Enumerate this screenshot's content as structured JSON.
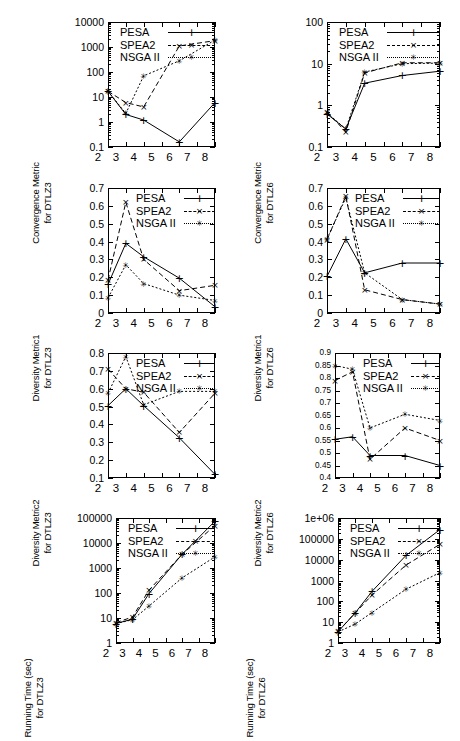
{
  "figure": {
    "width": 460,
    "height": 678,
    "columns": 2,
    "rows": 4,
    "series_names": [
      "PESA",
      "SPEA2",
      "NSGA II"
    ],
    "x_axis_label": "",
    "x_categories": [
      "2",
      "3",
      "4",
      "5",
      "6",
      "7",
      "8"
    ]
  },
  "legend": {
    "pesa": "PESA",
    "spea2": "SPEA2",
    "nsga2": "NSGA II"
  },
  "chart_data": [
    {
      "id": "convergence-dtlz3",
      "type": "line",
      "title": "",
      "ylabel_line1": "Convergence Metric",
      "ylabel_line2": "for DTLZ3",
      "xlabel": "",
      "yscale": "log",
      "ylim": [
        0.1,
        10000
      ],
      "yticks": [
        0.1,
        1,
        10,
        100,
        1000,
        10000
      ],
      "yticklabels": [
        "0.1",
        "1",
        "10",
        "100",
        "1000",
        "10000"
      ],
      "xlim": [
        2,
        8
      ],
      "xticks": [
        2,
        3,
        4,
        5,
        6,
        7,
        8
      ],
      "xticklabels": [
        "2",
        "3",
        "4",
        "5",
        "6",
        "7",
        "8"
      ],
      "grid": false,
      "legend_position": "top-left-inside",
      "x": [
        2,
        3,
        4,
        6,
        8
      ],
      "series": [
        {
          "name": "PESA",
          "values": [
            17,
            2.0,
            1.2,
            0.16,
            6.0
          ]
        },
        {
          "name": "SPEA2",
          "values": [
            17,
            6.0,
            4.0,
            1100,
            1800
          ]
        },
        {
          "name": "NSGA II",
          "values": [
            17,
            2.2,
            70,
            280,
            1900
          ]
        }
      ]
    },
    {
      "id": "convergence-dtlz6",
      "type": "line",
      "title": "",
      "ylabel_line1": "Convergence Metric",
      "ylabel_line2": "for DTLZ6",
      "xlabel": "",
      "yscale": "log",
      "ylim": [
        0.1,
        100
      ],
      "yticks": [
        0.1,
        1,
        10,
        100
      ],
      "yticklabels": [
        "0.1",
        "1",
        "10",
        "100"
      ],
      "xlim": [
        2,
        8
      ],
      "xticks": [
        2,
        3,
        4,
        5,
        6,
        7,
        8
      ],
      "xticklabels": [
        "2",
        "3",
        "4",
        "5",
        "6",
        "7",
        "8"
      ],
      "grid": false,
      "legend_position": "top-left-inside",
      "x": [
        2,
        3,
        4,
        6,
        8
      ],
      "series": [
        {
          "name": "PESA",
          "values": [
            0.62,
            0.27,
            3.4,
            5.2,
            6.6
          ]
        },
        {
          "name": "SPEA2",
          "values": [
            0.7,
            0.23,
            6.0,
            10.5,
            10.5
          ]
        },
        {
          "name": "NSGA II",
          "values": [
            0.66,
            0.27,
            6.3,
            10.0,
            10.3
          ]
        }
      ]
    },
    {
      "id": "diversity1-dtlz3",
      "type": "line",
      "title": "",
      "ylabel_line1": "Diversity Metric1",
      "ylabel_line2": "for DTLZ3",
      "xlabel": "",
      "yscale": "linear",
      "ylim": [
        0,
        0.7
      ],
      "yticks": [
        0,
        0.1,
        0.2,
        0.3,
        0.4,
        0.5,
        0.6,
        0.7
      ],
      "yticklabels": [
        "0",
        "0.1",
        "0.2",
        "0.3",
        "0.4",
        "0.5",
        "0.6",
        "0.7"
      ],
      "xlim": [
        2,
        8
      ],
      "xticks": [
        2,
        3,
        4,
        5,
        6,
        7,
        8
      ],
      "xticklabels": [
        "2",
        "3",
        "4",
        "5",
        "6",
        "7",
        "8"
      ],
      "grid": false,
      "legend_position": "top-right-inside",
      "x": [
        2,
        3,
        4,
        6,
        8
      ],
      "series": [
        {
          "name": "PESA",
          "values": [
            0.16,
            0.39,
            0.315,
            0.195,
            0.035
          ]
        },
        {
          "name": "SPEA2",
          "values": [
            0.185,
            0.62,
            0.3,
            0.125,
            0.155
          ]
        },
        {
          "name": "NSGA II",
          "values": [
            0.085,
            0.27,
            0.165,
            0.1,
            0.07
          ]
        }
      ]
    },
    {
      "id": "diversity1-dtlz6",
      "type": "line",
      "title": "",
      "ylabel_line1": "Diversity Metric1",
      "ylabel_line2": "for DTLZ6",
      "xlabel": "",
      "yscale": "linear",
      "ylim": [
        0,
        0.7
      ],
      "yticks": [
        0,
        0.1,
        0.2,
        0.3,
        0.4,
        0.5,
        0.6,
        0.7
      ],
      "yticklabels": [
        "0",
        "0.1",
        "0.2",
        "0.3",
        "0.4",
        "0.5",
        "0.6",
        "0.7"
      ],
      "xlim": [
        2,
        8
      ],
      "xticks": [
        2,
        3,
        4,
        5,
        6,
        7,
        8
      ],
      "xticklabels": [
        "2",
        "3",
        "4",
        "5",
        "6",
        "7",
        "8"
      ],
      "grid": false,
      "legend_position": "top-right-inside",
      "x": [
        2,
        3,
        4,
        6,
        8
      ],
      "series": [
        {
          "name": "PESA",
          "values": [
            0.205,
            0.415,
            0.225,
            0.28,
            0.28
          ]
        },
        {
          "name": "SPEA2",
          "values": [
            0.41,
            0.655,
            0.13,
            0.075,
            0.05
          ]
        },
        {
          "name": "NSGA II",
          "values": [
            0.415,
            0.645,
            0.225,
            0.075,
            0.05
          ]
        }
      ]
    },
    {
      "id": "diversity2-dtlz3",
      "type": "line",
      "title": "",
      "ylabel_line1": "Diversity Metric2",
      "ylabel_line2": "for DTLZ3",
      "xlabel": "",
      "yscale": "linear",
      "ylim": [
        0.1,
        0.8
      ],
      "yticks": [
        0.1,
        0.2,
        0.3,
        0.4,
        0.5,
        0.6,
        0.7,
        0.8
      ],
      "yticklabels": [
        "0.1",
        "0.2",
        "0.3",
        "0.4",
        "0.5",
        "0.6",
        "0.7",
        "0.8"
      ],
      "xlim": [
        2,
        8
      ],
      "xticks": [
        2,
        3,
        4,
        5,
        6,
        7,
        8
      ],
      "xticklabels": [
        "2",
        "3",
        "4",
        "5",
        "6",
        "7",
        "8"
      ],
      "grid": false,
      "legend_position": "top-right-inside",
      "x": [
        2,
        3,
        4,
        6,
        8
      ],
      "series": [
        {
          "name": "PESA",
          "values": [
            0.505,
            0.6,
            0.505,
            0.325,
            0.12
          ]
        },
        {
          "name": "SPEA2",
          "values": [
            0.71,
            0.6,
            0.58,
            0.355,
            0.575
          ]
        },
        {
          "name": "NSGA II",
          "values": [
            0.575,
            0.78,
            0.51,
            0.585,
            0.585
          ]
        }
      ]
    },
    {
      "id": "diversity2-dtlz6",
      "type": "line",
      "title": "",
      "ylabel_line1": "Diversity Metric2",
      "ylabel_line2": "for DTLZ6",
      "xlabel": "",
      "yscale": "linear",
      "ylim": [
        0.4,
        0.9
      ],
      "yticks": [
        0.4,
        0.45,
        0.5,
        0.55,
        0.6,
        0.65,
        0.7,
        0.75,
        0.8,
        0.85,
        0.9
      ],
      "yticklabels": [
        "0.4",
        "0.45",
        "0.5",
        "0.55",
        "0.6",
        "0.65",
        "0.7",
        "0.75",
        "0.8",
        "0.85",
        "0.9"
      ],
      "xlim": [
        2,
        8
      ],
      "xticks": [
        2,
        3,
        4,
        5,
        6,
        7,
        8
      ],
      "xticklabels": [
        "2",
        "3",
        "4",
        "5",
        "6",
        "7",
        "8"
      ],
      "grid": false,
      "legend_position": "top-right-inside",
      "x": [
        2,
        3,
        4,
        6,
        8
      ],
      "series": [
        {
          "name": "PESA",
          "values": [
            0.555,
            0.565,
            0.49,
            0.49,
            0.45
          ]
        },
        {
          "name": "SPEA2",
          "values": [
            0.79,
            0.825,
            0.475,
            0.6,
            0.55
          ]
        },
        {
          "name": "NSGA II",
          "values": [
            0.85,
            0.835,
            0.6,
            0.655,
            0.63
          ]
        }
      ]
    },
    {
      "id": "runtime-dtlz3",
      "type": "line",
      "title": "",
      "ylabel_line1": "Running Time (sec)",
      "ylabel_line2": "for DTLZ3",
      "xlabel": "",
      "yscale": "log",
      "ylim": [
        1,
        100000
      ],
      "yticks": [
        1,
        10,
        100,
        1000,
        10000,
        100000
      ],
      "yticklabels": [
        "1",
        "10",
        "100",
        "1000",
        "10000",
        "100000"
      ],
      "xlim": [
        2,
        8
      ],
      "xticks": [
        2,
        3,
        4,
        5,
        6,
        7,
        8
      ],
      "xticklabels": [
        "2",
        "3",
        "4",
        "5",
        "6",
        "7",
        "8"
      ],
      "grid": false,
      "legend_position": "top-left-inside",
      "x": [
        2,
        3,
        4,
        6,
        8
      ],
      "series": [
        {
          "name": "PESA",
          "values": [
            6.0,
            9.0,
            95,
            3500,
            75000
          ]
        },
        {
          "name": "SPEA2",
          "values": [
            6.5,
            11,
            130,
            3500,
            50000
          ]
        },
        {
          "name": "NSGA II",
          "values": [
            6.0,
            8.5,
            30,
            400,
            2800
          ]
        }
      ]
    },
    {
      "id": "runtime-dtlz6",
      "type": "line",
      "title": "",
      "ylabel_line1": "Running Time (sec)",
      "ylabel_line2": "for DTLZ6",
      "xlabel": "",
      "yscale": "log",
      "ylim": [
        1,
        1000000
      ],
      "yticks": [
        1,
        10,
        100,
        1000,
        10000,
        100000,
        1000000
      ],
      "yticklabels": [
        "1",
        "10",
        "100",
        "1000",
        "10000",
        "100000",
        "1e+06"
      ],
      "xlim": [
        2,
        8
      ],
      "xticks": [
        2,
        3,
        4,
        5,
        6,
        7,
        8
      ],
      "xticklabels": [
        "2",
        "3",
        "4",
        "5",
        "6",
        "7",
        "8"
      ],
      "grid": false,
      "legend_position": "top-left-inside",
      "x": [
        2,
        3,
        4,
        6,
        8
      ],
      "series": [
        {
          "name": "PESA",
          "values": [
            3.5,
            27,
            300,
            16000,
            280000
          ]
        },
        {
          "name": "SPEA2",
          "values": [
            3.6,
            27,
            200,
            5500,
            55000
          ]
        },
        {
          "name": "NSGA II",
          "values": [
            3.4,
            8.0,
            29,
            380,
            2400
          ]
        }
      ]
    }
  ]
}
